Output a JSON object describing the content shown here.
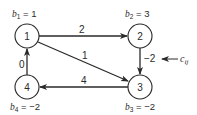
{
  "diagram": {
    "type": "network-flow-graph",
    "colors": {
      "stroke": "#2a2a2a",
      "background": "#ffffff"
    },
    "nodes": [
      {
        "id": "1",
        "label": "1",
        "supply_var": "b",
        "supply_sub": "1",
        "supply_value": "1"
      },
      {
        "id": "2",
        "label": "2",
        "supply_var": "b",
        "supply_sub": "2",
        "supply_value": "3"
      },
      {
        "id": "3",
        "label": "3",
        "supply_var": "b",
        "supply_sub": "3",
        "supply_value": "−2"
      },
      {
        "id": "4",
        "label": "4",
        "supply_var": "b",
        "supply_sub": "4",
        "supply_value": "−2"
      }
    ],
    "edges": [
      {
        "from": "1",
        "to": "2",
        "cost": "2"
      },
      {
        "from": "1",
        "to": "3",
        "cost": "1"
      },
      {
        "from": "2",
        "to": "3",
        "cost": "−2"
      },
      {
        "from": "3",
        "to": "4",
        "cost": "4"
      },
      {
        "from": "4",
        "to": "1",
        "cost": "0"
      }
    ],
    "annotation": {
      "var": "c",
      "sub": "ij",
      "points_to_edge": "2-3"
    },
    "eq": "="
  }
}
